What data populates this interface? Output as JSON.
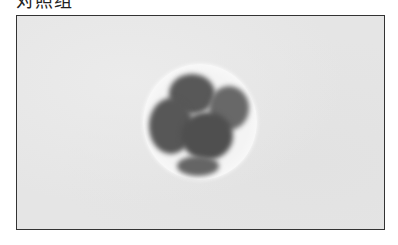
{
  "figure": {
    "caption": "对照组",
    "caption_clipped": true,
    "panel": {
      "subject": "embryo-micrograph",
      "description": "Grayscale brightfield micrograph of a multi-cell embryo inside a round zona pellucida on a light gray background",
      "frame_border_color": "#333333",
      "background_color": "#e5e5e5"
    },
    "cells": [
      {
        "name": "cell-top-left",
        "shade": "#5a5a5a"
      },
      {
        "name": "cell-top-right",
        "shade": "#6a6a6a"
      },
      {
        "name": "cell-left",
        "shade": "#555555"
      },
      {
        "name": "cell-center",
        "shade": "#4e4e4e"
      },
      {
        "name": "cell-bottom",
        "shade": "#666666"
      }
    ]
  }
}
